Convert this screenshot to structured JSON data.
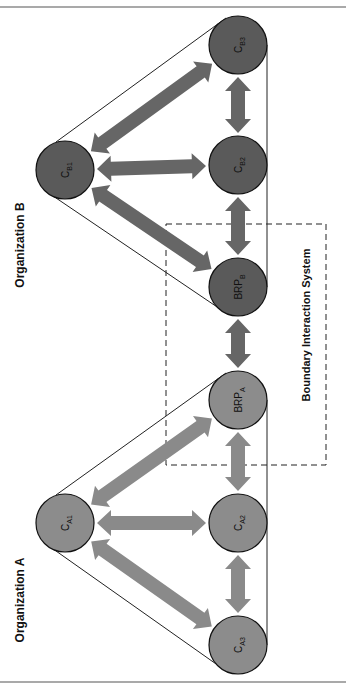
{
  "diagram": {
    "top_text_fragment": "",
    "organizations": [
      {
        "id": "B",
        "label": "Organization B",
        "arrow_color": "#666666",
        "node_color": "#5a5a5a"
      },
      {
        "id": "A",
        "label": "Organization A",
        "arrow_color": "#8a8a8a",
        "node_color": "#8c8c8c"
      }
    ],
    "boundary_label": "Boundary Interaction System",
    "nodes": [
      {
        "id": "CB3",
        "main": "C",
        "sub": "B3",
        "x": 238,
        "y": 45,
        "org": "B"
      },
      {
        "id": "CB2",
        "main": "C",
        "sub": "B2",
        "x": 238,
        "y": 165,
        "org": "B"
      },
      {
        "id": "BRPB",
        "main": "BRP",
        "sub": "B",
        "x": 238,
        "y": 287,
        "org": "B"
      },
      {
        "id": "CB1",
        "main": "C",
        "sub": "B1",
        "x": 65,
        "y": 170,
        "org": "B"
      },
      {
        "id": "BRPA",
        "main": "BRP",
        "sub": "A",
        "x": 238,
        "y": 400,
        "org": "A"
      },
      {
        "id": "CA2",
        "main": "C",
        "sub": "A2",
        "x": 238,
        "y": 523,
        "org": "A"
      },
      {
        "id": "CA3",
        "main": "C",
        "sub": "A3",
        "x": 238,
        "y": 645,
        "org": "A"
      },
      {
        "id": "CA1",
        "main": "C",
        "sub": "A1",
        "x": 65,
        "y": 523,
        "org": "A"
      }
    ],
    "edges": [
      {
        "from": "CB1",
        "to": "CB3",
        "org": "B"
      },
      {
        "from": "CB1",
        "to": "CB2",
        "org": "B"
      },
      {
        "from": "CB1",
        "to": "BRPB",
        "org": "B"
      },
      {
        "from": "CB3",
        "to": "CB2",
        "org": "B"
      },
      {
        "from": "CB2",
        "to": "BRPB",
        "org": "B"
      },
      {
        "from": "BRPB",
        "to": "BRPA",
        "org": "B"
      },
      {
        "from": "CA1",
        "to": "BRPA",
        "org": "A"
      },
      {
        "from": "CA1",
        "to": "CA2",
        "org": "A"
      },
      {
        "from": "CA1",
        "to": "CA3",
        "org": "A"
      },
      {
        "from": "BRPA",
        "to": "CA2",
        "org": "A"
      },
      {
        "from": "CA2",
        "to": "CA3",
        "org": "A"
      }
    ]
  }
}
